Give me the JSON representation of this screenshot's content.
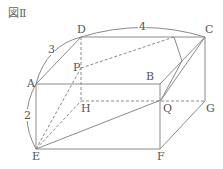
{
  "figure": {
    "title": "図Ⅱ",
    "vertices": {
      "A": "A",
      "B": "B",
      "C": "C",
      "D": "D",
      "E": "E",
      "F": "F",
      "G": "G",
      "H": "H",
      "P": "P",
      "Q": "Q"
    },
    "dimensions": {
      "AD": "3",
      "DC": "4",
      "AE": "2"
    },
    "colors": {
      "line": "#8a8a8a",
      "text": "#555555"
    }
  }
}
